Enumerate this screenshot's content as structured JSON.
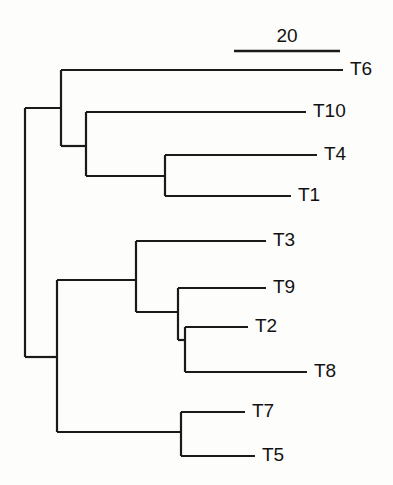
{
  "figure": {
    "kind": "phylogenetic-tree",
    "orientation": "left-to-right",
    "background_color": "#fdfdfc",
    "line_color": "#1a1a1a"
  },
  "scale_bar": {
    "label": "20",
    "x_start": 234,
    "x_end": 340,
    "y": 51,
    "label_x": 287,
    "label_y": 42
  },
  "chart_data": {
    "type": "tree",
    "title": "",
    "taxa": [
      "T6",
      "T10",
      "T4",
      "T1",
      "T3",
      "T9",
      "T2",
      "T8",
      "T7",
      "T5"
    ],
    "scale_bar_value": 20,
    "scale_bar_pixels": 106,
    "leaves": [
      {
        "name": "T6",
        "y": 70,
        "tip_x": 343,
        "parent_x": 61,
        "label_x": 350
      },
      {
        "name": "T10",
        "y": 112,
        "tip_x": 306,
        "parent_x": 86,
        "label_x": 313
      },
      {
        "name": "T4",
        "y": 155,
        "tip_x": 317,
        "parent_x": 165,
        "label_x": 324
      },
      {
        "name": "T1",
        "y": 196,
        "tip_x": 291,
        "parent_x": 165,
        "label_x": 298
      },
      {
        "name": "T3",
        "y": 241,
        "tip_x": 266,
        "parent_x": 136,
        "label_x": 273
      },
      {
        "name": "T9",
        "y": 288,
        "tip_x": 266,
        "parent_x": 178,
        "label_x": 273
      },
      {
        "name": "T2",
        "y": 327,
        "tip_x": 248,
        "parent_x": 185,
        "label_x": 255
      },
      {
        "name": "T8",
        "y": 372,
        "tip_x": 307,
        "parent_x": 185,
        "label_x": 314
      },
      {
        "name": "T7",
        "y": 412,
        "tip_x": 245,
        "parent_x": 181,
        "label_x": 252
      },
      {
        "name": "T5",
        "y": 456,
        "tip_x": 255,
        "parent_x": 181,
        "label_x": 262
      }
    ],
    "internal_nodes": [
      {
        "id": "root",
        "x": 25,
        "y_top": 108,
        "y_bottom": 357,
        "stem_from_x": 25,
        "stem_y": 108,
        "children": [
          "cladeA",
          "cladeB"
        ]
      },
      {
        "id": "cladeA",
        "x": 61,
        "y_top": 70,
        "y_bottom": 146,
        "stem_from_x": 25,
        "stem_y": 108,
        "children": [
          "T6",
          "cladeA2"
        ]
      },
      {
        "id": "cladeA2",
        "x": 86,
        "y_top": 112,
        "y_bottom": 176,
        "stem_from_x": 61,
        "stem_y": 146,
        "children": [
          "T10",
          "cladeA3"
        ]
      },
      {
        "id": "cladeA3",
        "x": 165,
        "y_top": 155,
        "y_bottom": 196,
        "stem_from_x": 86,
        "stem_y": 176,
        "children": [
          "T4",
          "T1"
        ]
      },
      {
        "id": "cladeB",
        "x": 57,
        "y_top": 280,
        "y_bottom": 432,
        "stem_from_x": 25,
        "stem_y": 357,
        "children": [
          "cladeB1",
          "cladeB4"
        ]
      },
      {
        "id": "cladeB1",
        "x": 136,
        "y_top": 241,
        "y_bottom": 312,
        "stem_from_x": 57,
        "stem_y": 280,
        "children": [
          "T3",
          "cladeB2"
        ]
      },
      {
        "id": "cladeB2",
        "x": 178,
        "y_top": 288,
        "y_bottom": 340,
        "stem_from_x": 136,
        "stem_y": 312,
        "children": [
          "T9",
          "cladeB3"
        ]
      },
      {
        "id": "cladeB3",
        "x": 185,
        "y_top": 327,
        "y_bottom": 372,
        "stem_from_x": 178,
        "stem_y": 340,
        "children": [
          "T2",
          "T8"
        ]
      },
      {
        "id": "cladeB4",
        "x": 181,
        "y_top": 412,
        "y_bottom": 456,
        "stem_from_x": 57,
        "stem_y": 432,
        "children": [
          "T7",
          "T5"
        ]
      }
    ]
  }
}
